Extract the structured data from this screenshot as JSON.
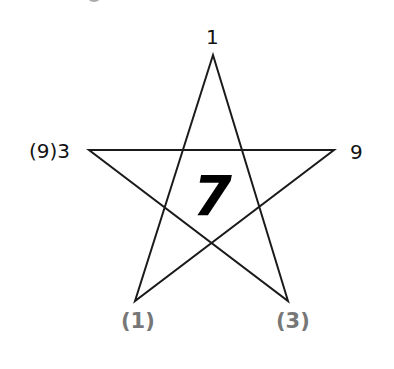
{
  "diagram": {
    "type": "pentagram",
    "colors": {
      "line": "#1a1a1a",
      "primary_label": "#111111",
      "secondary_label": "#777777",
      "center": "#000000"
    },
    "vertices": {
      "top": {
        "x": 213,
        "y": 55,
        "label": "1"
      },
      "left": {
        "x": 89,
        "y": 150,
        "label": "(9)3"
      },
      "right": {
        "x": 334,
        "y": 150,
        "label": "9"
      },
      "bottom_left": {
        "x": 135,
        "y": 301,
        "label": "(1)"
      },
      "bottom_right": {
        "x": 288,
        "y": 301,
        "label": "(3)"
      }
    },
    "center_value": "7"
  }
}
